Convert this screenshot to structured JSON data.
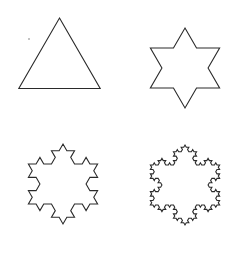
{
  "figure": {
    "stroke_color": "#2a2a2a",
    "stroke_width": 1.1,
    "background": "#ffffff",
    "panels": [
      {
        "name": "iteration-0-triangle",
        "iteration": 0,
        "cx": 59.5,
        "cy": 68,
        "r": 54
      },
      {
        "name": "iteration-1-star",
        "iteration": 1,
        "cx": 185,
        "cy": 68,
        "r": 54
      },
      {
        "name": "iteration-2-snowflake",
        "iteration": 2,
        "cx": 63,
        "cy": 184,
        "r": 54
      },
      {
        "name": "iteration-3-snowflake",
        "iteration": 3,
        "cx": 185,
        "cy": 185,
        "r": 54
      }
    ],
    "stray_dot": {
      "cx": 29,
      "cy": 39,
      "r": 0.8
    }
  }
}
